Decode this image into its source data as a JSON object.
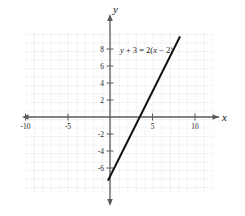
{
  "chart_data": {
    "type": "line",
    "title": "",
    "subtitle": "",
    "xlabel": "x",
    "ylabel": "y",
    "xlim": [
      -11,
      12
    ],
    "ylim": [
      -9.5,
      9.5
    ],
    "grid": true,
    "grid_step": 1,
    "legend": "none",
    "annotation": "y + 3 = 2(x − 2)",
    "equation_parts": {
      "lhs_var": "y",
      "plus": "+",
      "lhs_const": "3",
      "equals": "=",
      "slope": "2",
      "open_paren": "(",
      "rhs_var": "x",
      "minus": "−",
      "rhs_const": "2",
      "close_paren": ")"
    },
    "series": [
      {
        "name": "y + 3 = 2(x − 2)",
        "slope": 2,
        "intercept": -7,
        "x_intercept": 3.5,
        "points": [
          [
            -0.2,
            -7.4
          ],
          [
            2,
            -3
          ],
          [
            3.5,
            0
          ],
          [
            8.2,
            9.4
          ]
        ],
        "color": "#111111"
      }
    ],
    "xticks": [
      -10,
      -5,
      5,
      10
    ],
    "xtick_labels": [
      "-10",
      "-5",
      "5",
      "10"
    ],
    "yticks": [
      8,
      6,
      4,
      2,
      -2,
      -4,
      -6
    ],
    "ytick_labels": [
      "8",
      "6",
      "4",
      "2",
      "-2",
      "-4",
      "-6"
    ],
    "axis_arrows": [
      "left",
      "right",
      "up",
      "down"
    ]
  },
  "labels": {
    "x_axis_name": "x",
    "y_axis_name": "y",
    "x_neg10": "-10",
    "x_neg5": "-5",
    "x_pos5": "5",
    "x_pos10": "10",
    "y_8": "8",
    "y_6": "6",
    "y_4": "4",
    "y_2": "2",
    "y_neg2": "-2",
    "y_neg4": "-4",
    "y_neg6": "-6"
  },
  "colors": {
    "line": "#111111",
    "axis": "#4a4a4a",
    "grid": "#b9b9b9",
    "background": "#ffffff",
    "text": "#1a1a1a"
  }
}
